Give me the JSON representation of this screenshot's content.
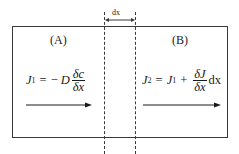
{
  "diagram": {
    "type": "diffusion flux schematic",
    "width_marker": {
      "label": "dx"
    },
    "regions": [
      {
        "id": "A",
        "label": "(A)",
        "equation": {
          "lhs": "J",
          "lhs_sub": "1",
          "equals": "=",
          "minus": "−",
          "coef": "D",
          "frac_num": "δc",
          "frac_den": "δx",
          "text": "J₁ = −D δc/δx"
        },
        "arrow": "right-arrow"
      },
      {
        "id": "B",
        "label": "(B)",
        "equation": {
          "lhs": "J",
          "lhs_sub": "2",
          "equals": "=",
          "term1": "J",
          "term1_sub": "1",
          "plus": "+",
          "frac_num": "δJ",
          "frac_den": "δx",
          "suffix": "dx",
          "text": "J₂ = J₁ + (δJ/δx) dx"
        },
        "arrow": "right-arrow"
      }
    ],
    "colors": {
      "line": "#3a3a3a",
      "text": "#1a1a1a",
      "background": "#ffffff"
    }
  }
}
